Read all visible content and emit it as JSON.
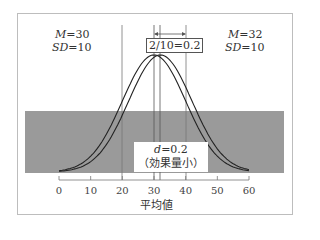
{
  "group_a": {
    "mean_label": "M",
    "mean_value": "=30",
    "sd_label": "SD",
    "sd_value": "=10"
  },
  "group_b": {
    "mean_label": "M",
    "mean_value": "=32",
    "sd_label": "SD",
    "sd_value": "=10"
  },
  "difference_box": "2/10=0.2",
  "effect": {
    "line1_var": "d",
    "line1_val": "=0.2",
    "line2": "（効果量小）"
  },
  "xaxis": {
    "label": "平均値",
    "ticks": [
      "0",
      "10",
      "20",
      "30",
      "40",
      "50",
      "60"
    ]
  },
  "colors": {
    "band": "#9a9a9a",
    "curve": "#222222",
    "border": "#bdbdbd",
    "guide": "#777777"
  },
  "chart_data": {
    "type": "line",
    "title": "",
    "xlabel": "平均値",
    "ylabel": "",
    "xlim": [
      0,
      60
    ],
    "series": [
      {
        "name": "M=30, SD=10",
        "mean": 30,
        "sd": 10
      },
      {
        "name": "M=32, SD=10",
        "mean": 32,
        "sd": 10
      }
    ],
    "annotations": [
      "2/10=0.2",
      "d=0.2 (効果量小)"
    ],
    "vertical_guides": [
      20,
      30,
      32,
      40
    ]
  }
}
